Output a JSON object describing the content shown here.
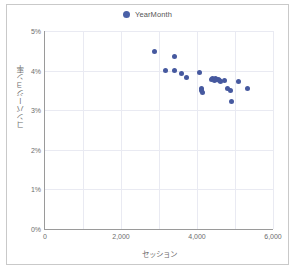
{
  "chart_data": {
    "type": "scatter",
    "title": "",
    "xlabel": "セッション",
    "ylabel": "コンバージョン率",
    "xlim": [
      0,
      6000
    ],
    "ylim": [
      0,
      0.05
    ],
    "grid": true,
    "legend_position": "top-center",
    "series": [
      {
        "name": "YearMonth",
        "color": "#46599f",
        "marker": "circle",
        "points": [
          {
            "x": 2890,
            "y": 4.49
          },
          {
            "x": 3420,
            "y": 4.36
          },
          {
            "x": 3160,
            "y": 4.01
          },
          {
            "x": 3410,
            "y": 4.0
          },
          {
            "x": 3600,
            "y": 3.93
          },
          {
            "x": 3720,
            "y": 3.83
          },
          {
            "x": 4060,
            "y": 3.96
          },
          {
            "x": 4110,
            "y": 3.55
          },
          {
            "x": 4130,
            "y": 3.5
          },
          {
            "x": 4140,
            "y": 3.45
          },
          {
            "x": 4380,
            "y": 3.77
          },
          {
            "x": 4420,
            "y": 3.79
          },
          {
            "x": 4450,
            "y": 3.76
          },
          {
            "x": 4490,
            "y": 3.8
          },
          {
            "x": 4520,
            "y": 3.77
          },
          {
            "x": 4560,
            "y": 3.78
          },
          {
            "x": 4580,
            "y": 3.75
          },
          {
            "x": 4620,
            "y": 3.73
          },
          {
            "x": 4720,
            "y": 3.75
          },
          {
            "x": 4790,
            "y": 3.54
          },
          {
            "x": 4870,
            "y": 3.49
          },
          {
            "x": 4900,
            "y": 3.21
          },
          {
            "x": 5080,
            "y": 3.72
          },
          {
            "x": 5330,
            "y": 3.56
          }
        ]
      }
    ],
    "x_ticks": [
      {
        "value": 0,
        "label": "0"
      },
      {
        "value": 2000,
        "label": "2,000"
      },
      {
        "value": 4000,
        "label": "4,000"
      },
      {
        "value": 6000,
        "label": "6,000"
      }
    ],
    "y_ticks": [
      {
        "value": 0,
        "label": "0%"
      },
      {
        "value": 1,
        "label": "1%"
      },
      {
        "value": 2,
        "label": "2%"
      },
      {
        "value": 3,
        "label": "3%"
      },
      {
        "value": 4,
        "label": "4%"
      },
      {
        "value": 5,
        "label": "5%"
      }
    ]
  },
  "legend": {
    "items": [
      {
        "label": "YearMonth",
        "color": "#46599f"
      }
    ]
  },
  "axes": {
    "x_title": "セッション",
    "y_title": "コンバージョン率"
  }
}
